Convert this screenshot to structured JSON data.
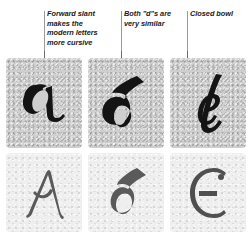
{
  "figure": {
    "name": "letterform-comparison-figure",
    "background_color": "#ffffff",
    "rows": 2,
    "columns": 3
  },
  "callouts": [
    {
      "id": "callout-forward-slant",
      "text": "Forward slant makes the modern letters more cursive",
      "points_to": "modern-letter-a",
      "column": 1
    },
    {
      "id": "callout-both-ds",
      "text": "Both \"d\"s are very similar",
      "points_to": "modern-letter-d",
      "column": 2
    },
    {
      "id": "callout-closed-bowl",
      "text": "Closed bowl",
      "points_to": "modern-letter-e",
      "column": 3
    }
  ],
  "panels": {
    "top_row": {
      "label": "modern-cursive-letters",
      "background_color": "#cfcfcf",
      "ink_color": "#141414",
      "items": [
        {
          "id": "modern-letter-a",
          "letter": "a",
          "style": "modern cursive"
        },
        {
          "id": "modern-letter-d",
          "letter": "d",
          "style": "modern cursive"
        },
        {
          "id": "modern-letter-e",
          "letter": "e",
          "style": "modern cursive"
        }
      ]
    },
    "bottom_row": {
      "label": "historic-letters",
      "background_color": "#eeeeee",
      "ink_color": "#555555",
      "items": [
        {
          "id": "historic-letter-a",
          "letter": "a",
          "style": "historic uncial"
        },
        {
          "id": "historic-letter-d",
          "letter": "d",
          "style": "historic uncial"
        },
        {
          "id": "historic-letter-e",
          "letter": "e",
          "style": "historic uncial"
        }
      ]
    }
  },
  "colors": {
    "leader_line": "#6d6d6d",
    "caption_rule": "#9a9a9a",
    "caption_text": "#1a1a1a"
  }
}
